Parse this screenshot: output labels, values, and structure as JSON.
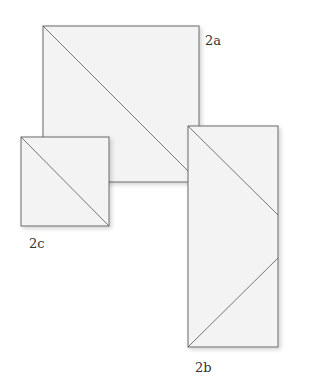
{
  "labels": {
    "a": "2a",
    "b": "2b",
    "c": "2c"
  },
  "colors": {
    "fill": "#f3f3f3",
    "stroke": "#6b6b6b",
    "shadow": "#d8d8d8"
  }
}
